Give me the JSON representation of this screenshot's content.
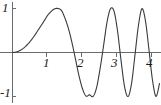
{
  "figure": {
    "kind": "function-plot",
    "background_color": "#ffffff",
    "curve_color": "#3a3a3a",
    "axis_color": "#6b6b6b",
    "label_color": "#1a1a1a"
  },
  "axes": {
    "x_axis_label": "",
    "y_axis_label": "",
    "x_ticks": [
      {
        "value": 1,
        "label": "1"
      },
      {
        "value": 2,
        "label": "2"
      },
      {
        "value": 3,
        "label": "3"
      },
      {
        "value": 4,
        "label": "4"
      }
    ],
    "y_ticks": [
      {
        "value": 1,
        "label": "1"
      },
      {
        "value": -1,
        "label": "-1"
      }
    ]
  },
  "chart_data": {
    "type": "line",
    "title": "",
    "xlabel": "",
    "ylabel": "",
    "xlim": [
      -0.35,
      4.35
    ],
    "ylim": [
      -1.35,
      1.35
    ],
    "grid": false,
    "legend": "none",
    "xticks": [
      1,
      2,
      3,
      4
    ],
    "xticklabels": [
      "1",
      "2",
      "3",
      "4"
    ],
    "yticks": [
      -1,
      1
    ],
    "yticklabels": [
      "-1",
      "1"
    ],
    "annotations": [],
    "series": [
      {
        "name": "chirp",
        "description": "oscillation with amplitude 1 and frequency increasing with x; starts flat at the origin",
        "peaks_x": [
          1.35,
          2.82,
          3.97
        ],
        "troughs_x": [
          2.28,
          3.45
        ],
        "zero_crossings_x": [
          0.0,
          1.95,
          2.57,
          3.17,
          3.72
        ],
        "x": [
          0.0,
          0.1,
          0.2,
          0.3,
          0.4,
          0.5,
          0.6,
          0.7,
          0.8,
          0.9,
          1.0,
          1.1,
          1.2,
          1.3,
          1.4,
          1.5,
          1.6,
          1.7,
          1.8,
          1.9,
          2.0,
          2.1,
          2.2,
          2.3,
          2.4,
          2.5,
          2.6,
          2.7,
          2.8,
          2.9,
          3.0,
          3.1,
          3.2,
          3.3,
          3.4,
          3.5,
          3.6,
          3.7,
          3.8,
          3.9,
          4.0,
          4.1,
          4.2
        ],
        "y": [
          0.0,
          0.01,
          0.04,
          0.09,
          0.159,
          0.247,
          0.352,
          0.47,
          0.592,
          0.712,
          0.841,
          0.93,
          0.991,
          1.0,
          0.952,
          0.778,
          0.539,
          0.22,
          -0.153,
          -0.53,
          -0.824,
          -0.99,
          -0.962,
          -1.0,
          -0.804,
          -0.38,
          0.144,
          0.688,
          0.994,
          0.94,
          0.494,
          -0.172,
          -0.768,
          -0.999,
          -0.71,
          -0.05,
          0.625,
          0.997,
          0.713,
          0.056,
          -0.63,
          -0.997,
          -0.704
        ]
      }
    ]
  }
}
